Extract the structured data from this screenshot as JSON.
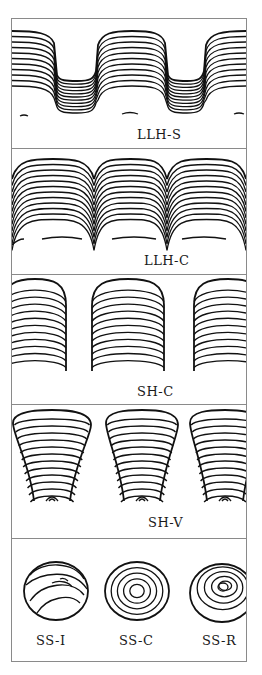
{
  "figure": {
    "panels": [
      {
        "id": "llh-s",
        "label": "LLH-S",
        "description": "Laterally linked hemispheroids, spaced; wavy stacked laminae with flat-topped depressions"
      },
      {
        "id": "llh-c",
        "label": "LLH-C",
        "description": "Laterally linked hemispheroids, close; contiguous domes of stacked laminae"
      },
      {
        "id": "sh-c",
        "label": "SH-C",
        "description": "Stacked hemispheroids, constant basal radius; separate columns of convex laminae"
      },
      {
        "id": "sh-v",
        "label": "SH-V",
        "description": "Stacked hemispheroids, variable basal radius; inverted cone shaped columns"
      },
      {
        "id": "ss",
        "labels": [
          "SS-I",
          "SS-C",
          "SS-R"
        ],
        "description": "Spheroidal structures: inverted, concentric, random laminae"
      }
    ]
  }
}
